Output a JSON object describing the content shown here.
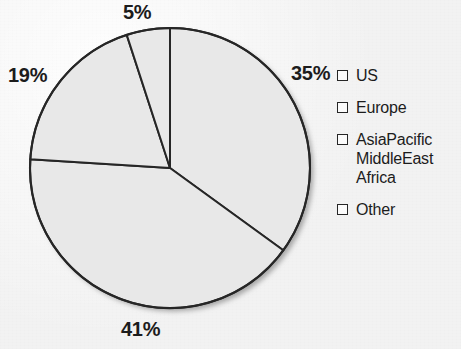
{
  "chart_data": {
    "type": "pie",
    "title": "",
    "subtitle": "",
    "xlabel": "",
    "ylabel": "",
    "grid": false,
    "legend_position": "right",
    "start_angle_deg": 0,
    "direction": "clockwise",
    "units": "percent",
    "categories": [
      "US",
      "Europe",
      "AsiaPacific MiddleEast Africa",
      "Other"
    ],
    "values": [
      35,
      41,
      19,
      5
    ],
    "slices": [
      {
        "label": "US",
        "value": 35,
        "value_text": "35%",
        "sweep_deg": 126.0,
        "start_deg": 0.0,
        "fill": "#e8e8e8",
        "stroke": "#262626",
        "label_position": "right"
      },
      {
        "label": "Europe",
        "value": 41,
        "value_text": "41%",
        "sweep_deg": 147.6,
        "start_deg": 126.0,
        "fill": "#e8e8e8",
        "stroke": "#262626",
        "label_position": "bottom"
      },
      {
        "label": "AsiaPacific MiddleEast Africa",
        "value": 19,
        "value_text": "19%",
        "sweep_deg": 68.4,
        "start_deg": 273.6,
        "fill": "#e8e8e8",
        "stroke": "#262626",
        "label_position": "left"
      },
      {
        "label": "Other",
        "value": 5,
        "value_text": "5%",
        "sweep_deg": 18.0,
        "start_deg": 342.0,
        "fill": "#e8e8e8",
        "stroke": "#262626",
        "label_position": "top"
      }
    ],
    "annotations": [
      "35%",
      "41%",
      "19%",
      "5%"
    ]
  },
  "labels": {
    "us": "35%",
    "europe": "41%",
    "asiapacific": "19%",
    "other": "5%"
  },
  "legend": {
    "items": [
      {
        "label": "US",
        "line1": "US",
        "line2": "",
        "line3": "",
        "swatch_icon": "square-outline-icon"
      },
      {
        "label": "Europe",
        "line1": "Europe",
        "line2": "",
        "line3": "",
        "swatch_icon": "square-outline-icon"
      },
      {
        "label": "AsiaPacific MiddleEast Africa",
        "line1": "AsiaPacific",
        "line2": "MiddleEast",
        "line3": "Africa",
        "swatch_icon": "square-outline-icon"
      },
      {
        "label": "Other",
        "line1": "Other",
        "line2": "",
        "line3": "",
        "swatch_icon": "square-outline-icon"
      }
    ]
  },
  "colors": {
    "background": "#f2f2f2",
    "slice_fill": "#e8e8e8",
    "slice_stroke": "#262626",
    "text": "#1c1c1c",
    "shadow": "#9a9a9a"
  }
}
